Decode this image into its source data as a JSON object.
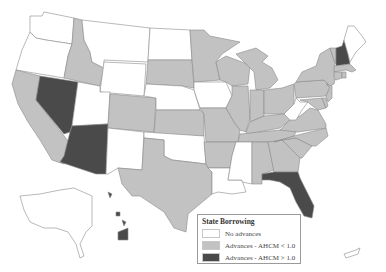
{
  "map": {
    "title": "",
    "region": "United States",
    "colors": {
      "no_advances": "#ffffff",
      "advances_low": "#c2c2c2",
      "advances_high": "#4a4a4a",
      "border": "#8a8a8a"
    },
    "legend": {
      "title": "State Borrowing",
      "items": [
        {
          "label": "No advances",
          "key": "no_advances"
        },
        {
          "label": "Advances - AHCM < 1.0",
          "key": "advances_low"
        },
        {
          "label": "Advances - AHCM > 1.0",
          "key": "advances_high"
        }
      ]
    },
    "states": {
      "WA": "no_advances",
      "OR": "no_advances",
      "CA": "advances_low",
      "NV": "advances_high",
      "ID": "advances_low",
      "MT": "no_advances",
      "WY": "no_advances",
      "UT": "no_advances",
      "AZ": "advances_high",
      "CO": "advances_low",
      "NM": "no_advances",
      "ND": "no_advances",
      "SD": "advances_low",
      "NE": "no_advances",
      "KS": "advances_low",
      "OK": "no_advances",
      "TX": "advances_low",
      "MN": "advances_low",
      "IA": "no_advances",
      "MO": "advances_low",
      "AR": "advances_low",
      "LA": "no_advances",
      "WI": "advances_low",
      "IL": "advances_low",
      "MI": "advances_low",
      "IN": "advances_low",
      "OH": "advances_low",
      "KY": "advances_low",
      "TN": "advances_low",
      "MS": "no_advances",
      "AL": "advances_low",
      "GA": "advances_low",
      "FL": "advances_high",
      "SC": "advances_low",
      "NC": "advances_low",
      "VA": "advances_low",
      "WV": "no_advances",
      "PA": "advances_low",
      "NY": "advances_low",
      "VT": "advances_low",
      "NH": "advances_high",
      "ME": "no_advances",
      "MA": "advances_low",
      "CT": "advances_low",
      "RI": "advances_low",
      "NJ": "advances_low",
      "DE": "advances_low",
      "MD": "advances_low",
      "AK": "no_advances",
      "HI": "advances_high",
      "PR": "no_advances"
    }
  }
}
